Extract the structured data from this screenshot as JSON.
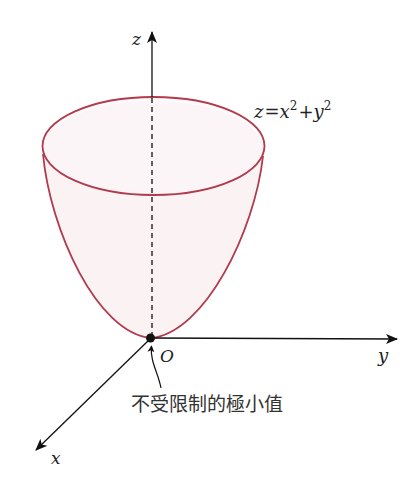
{
  "diagram": {
    "type": "3d-surface-plot",
    "surface": {
      "equation_lhs": "z",
      "equation_eq": "=",
      "equation_x": "x",
      "equation_plus": "+",
      "equation_y": "y",
      "exponent": "2",
      "outline_color": "#b03a4e",
      "fill_color": "#fbf2f4"
    },
    "axes": {
      "x_label": "x",
      "y_label": "y",
      "z_label": "z",
      "axis_color": "#1a1a1a"
    },
    "origin": {
      "label": "O",
      "point_color": "#111111"
    },
    "annotation": {
      "text": "不受限制的極小值"
    }
  }
}
